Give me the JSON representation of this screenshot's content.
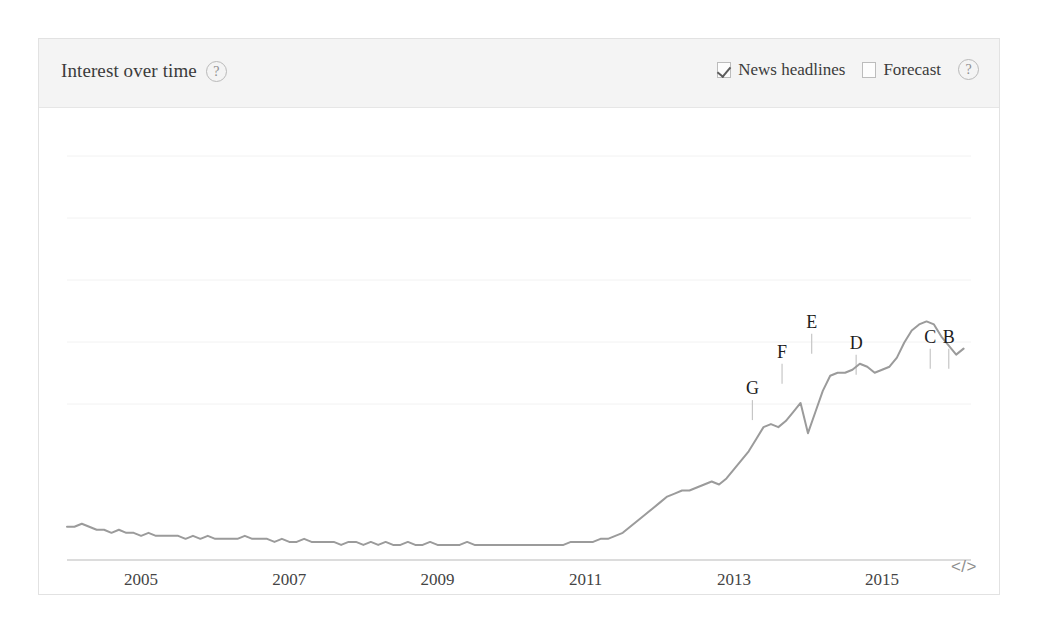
{
  "card": {
    "header": {
      "title": "Interest over time",
      "title_help_icon": "help-circle-icon",
      "help_label": "?",
      "controls": [
        {
          "label": "News headlines",
          "checked": true,
          "icon": "checkbox-checked-icon"
        },
        {
          "label": "Forecast",
          "checked": false,
          "icon": "checkbox-unchecked-icon"
        }
      ],
      "controls_help_label": "?"
    },
    "footer": {
      "embed_label": "</>",
      "embed_icon": "code-embed-icon"
    }
  },
  "chart_data": {
    "type": "line",
    "title": "Interest over time",
    "xlabel": "",
    "ylabel": "",
    "grid": true,
    "legend": false,
    "line_color": "#9b9b9b",
    "xlim": [
      2004.0,
      2016.2
    ],
    "ylim": [
      0,
      100
    ],
    "xticks": [
      "2005",
      "2007",
      "2009",
      "2011",
      "2013",
      "2015"
    ],
    "xtick_values": [
      2005,
      2007,
      2009,
      2011,
      2013,
      2015
    ],
    "annotations": [
      {
        "label": "G",
        "x": 2013.25,
        "y": 45
      },
      {
        "label": "F",
        "x": 2013.65,
        "y": 57
      },
      {
        "label": "E",
        "x": 2014.05,
        "y": 67
      },
      {
        "label": "D",
        "x": 2014.65,
        "y": 60
      },
      {
        "label": "C",
        "x": 2015.65,
        "y": 62
      },
      {
        "label": "B",
        "x": 2015.9,
        "y": 62
      }
    ],
    "x": [
      2004.0,
      2004.1,
      2004.2,
      2004.3,
      2004.4,
      2004.5,
      2004.6,
      2004.7,
      2004.8,
      2004.9,
      2005.0,
      2005.1,
      2005.2,
      2005.3,
      2005.4,
      2005.5,
      2005.6,
      2005.7,
      2005.8,
      2005.9,
      2006.0,
      2006.1,
      2006.2,
      2006.3,
      2006.4,
      2006.5,
      2006.6,
      2006.7,
      2006.8,
      2006.9,
      2007.0,
      2007.1,
      2007.2,
      2007.3,
      2007.4,
      2007.5,
      2007.6,
      2007.7,
      2007.8,
      2007.9,
      2008.0,
      2008.1,
      2008.2,
      2008.3,
      2008.4,
      2008.5,
      2008.6,
      2008.7,
      2008.8,
      2008.9,
      2009.0,
      2009.1,
      2009.2,
      2009.3,
      2009.4,
      2009.5,
      2009.6,
      2009.7,
      2009.8,
      2009.9,
      2010.0,
      2010.1,
      2010.2,
      2010.3,
      2010.4,
      2010.5,
      2010.6,
      2010.7,
      2010.8,
      2010.9,
      2011.0,
      2011.1,
      2011.2,
      2011.3,
      2011.4,
      2011.5,
      2011.6,
      2011.7,
      2011.8,
      2011.9,
      2012.0,
      2012.1,
      2012.2,
      2012.3,
      2012.4,
      2012.5,
      2012.6,
      2012.7,
      2012.8,
      2012.9,
      2013.0,
      2013.1,
      2013.2,
      2013.3,
      2013.4,
      2013.5,
      2013.6,
      2013.7,
      2013.8,
      2013.9,
      2014.0,
      2014.1,
      2014.2,
      2014.3,
      2014.4,
      2014.5,
      2014.6,
      2014.7,
      2014.8,
      2014.9,
      2015.0,
      2015.1,
      2015.2,
      2015.3,
      2015.4,
      2015.5,
      2015.6,
      2015.7,
      2015.8,
      2015.9,
      2016.0,
      2016.1
    ],
    "values": [
      11,
      11,
      12,
      11,
      10,
      10,
      9,
      10,
      9,
      9,
      8,
      9,
      8,
      8,
      8,
      8,
      7,
      8,
      7,
      8,
      7,
      7,
      7,
      7,
      8,
      7,
      7,
      7,
      6,
      7,
      6,
      6,
      7,
      6,
      6,
      6,
      6,
      5,
      6,
      6,
      5,
      6,
      5,
      6,
      5,
      5,
      6,
      5,
      5,
      6,
      5,
      5,
      5,
      5,
      6,
      5,
      5,
      5,
      5,
      5,
      5,
      5,
      5,
      5,
      5,
      5,
      5,
      5,
      6,
      6,
      6,
      6,
      7,
      7,
      8,
      9,
      11,
      13,
      15,
      17,
      19,
      21,
      22,
      23,
      23,
      24,
      25,
      26,
      25,
      27,
      30,
      33,
      36,
      40,
      44,
      45,
      44,
      46,
      49,
      52,
      42,
      49,
      56,
      61,
      62,
      62,
      63,
      65,
      64,
      62,
      63,
      64,
      67,
      72,
      76,
      78,
      79,
      78,
      74,
      71,
      68,
      70
    ]
  }
}
